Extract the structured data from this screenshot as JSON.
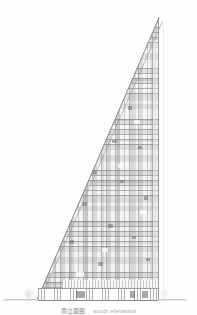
{
  "drawing": {
    "type": "architectural-elevation",
    "subject": "triangular high-rise tower",
    "background_color": "#fefefe",
    "line_color": "#8e8e8e",
    "facade_tone": "#b4b4b4"
  },
  "caption": {
    "cn": "南立面图",
    "en": "south elevation",
    "full": "南立面图 south elevation"
  },
  "building": {
    "name": "tower-elevation",
    "apex_label": "apex",
    "right_edge_label": "vertical facade edge",
    "hypotenuse_label": "sloped facade edge",
    "podium_label": "ground floor podium",
    "mezzanine_label": "mezzanine band",
    "floor_count": 54,
    "bay_count": 26
  },
  "site": {
    "ground_line_label": "ground line",
    "tree_left_label": "tree symbol",
    "tree_right_label": "tree symbol"
  },
  "guides": {
    "right_guide_label": "vertical construction guide"
  },
  "accent_panels": [
    {
      "left": 118,
      "top": 74,
      "width": 5,
      "height": 4
    },
    {
      "left": 104,
      "top": 94,
      "width": 4,
      "height": 4
    },
    {
      "left": 96,
      "top": 112,
      "width": 5,
      "height": 3
    },
    {
      "left": 128,
      "top": 106,
      "width": 4,
      "height": 4
    },
    {
      "left": 85,
      "top": 128,
      "width": 4,
      "height": 4
    },
    {
      "left": 112,
      "top": 140,
      "width": 5,
      "height": 3
    },
    {
      "left": 74,
      "top": 152,
      "width": 4,
      "height": 4
    },
    {
      "left": 138,
      "top": 146,
      "width": 4,
      "height": 3
    },
    {
      "left": 92,
      "top": 170,
      "width": 5,
      "height": 4
    },
    {
      "left": 63,
      "top": 186,
      "width": 4,
      "height": 4
    },
    {
      "left": 120,
      "top": 180,
      "width": 4,
      "height": 3
    },
    {
      "left": 82,
      "top": 202,
      "width": 5,
      "height": 4
    },
    {
      "left": 144,
      "top": 196,
      "width": 4,
      "height": 4
    },
    {
      "left": 55,
      "top": 218,
      "width": 4,
      "height": 3
    },
    {
      "left": 108,
      "top": 224,
      "width": 5,
      "height": 4
    },
    {
      "left": 70,
      "top": 240,
      "width": 4,
      "height": 4
    },
    {
      "left": 132,
      "top": 236,
      "width": 4,
      "height": 3
    },
    {
      "left": 47,
      "top": 256,
      "width": 4,
      "height": 4
    },
    {
      "left": 98,
      "top": 262,
      "width": 5,
      "height": 4
    },
    {
      "left": 146,
      "top": 258,
      "width": 4,
      "height": 3
    }
  ],
  "light_panels": [
    {
      "left": 126,
      "top": 60,
      "width": 6,
      "height": 4
    },
    {
      "left": 110,
      "top": 86,
      "width": 7,
      "height": 4
    },
    {
      "left": 134,
      "top": 120,
      "width": 6,
      "height": 4
    },
    {
      "left": 88,
      "top": 146,
      "width": 7,
      "height": 4
    },
    {
      "left": 118,
      "top": 164,
      "width": 6,
      "height": 4
    },
    {
      "left": 68,
      "top": 192,
      "width": 7,
      "height": 4
    },
    {
      "left": 140,
      "top": 210,
      "width": 6,
      "height": 4
    },
    {
      "left": 58,
      "top": 232,
      "width": 7,
      "height": 4
    },
    {
      "left": 102,
      "top": 248,
      "width": 6,
      "height": 4
    },
    {
      "left": 44,
      "top": 268,
      "width": 9,
      "height": 5
    },
    {
      "left": 76,
      "top": 272,
      "width": 8,
      "height": 5
    }
  ]
}
